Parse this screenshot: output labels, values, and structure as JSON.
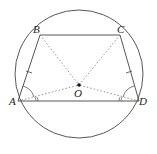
{
  "diagram": {
    "colors": {
      "stroke": "#444444",
      "dotted": "#777777",
      "text": "#222222"
    },
    "circle": {
      "cx": 79,
      "cy": 74,
      "r": 64
    },
    "points": {
      "A": {
        "label": "A",
        "x": 18,
        "y": 101
      },
      "B": {
        "label": "B",
        "x": 40,
        "y": 35
      },
      "C": {
        "label": "C",
        "x": 120,
        "y": 35
      },
      "D": {
        "label": "D",
        "x": 139,
        "y": 101
      },
      "O": {
        "label": "O",
        "x": 79,
        "y": 85
      }
    },
    "solid_segments": [
      "AB",
      "BC",
      "CD",
      "DA"
    ],
    "dotted_segments": [
      "BO",
      "CO",
      "AO",
      "DO"
    ],
    "tick_marks": [
      "AB",
      "CD"
    ],
    "angle_marks": [
      "BAD",
      "CDA",
      "OAD",
      "ODA"
    ]
  }
}
